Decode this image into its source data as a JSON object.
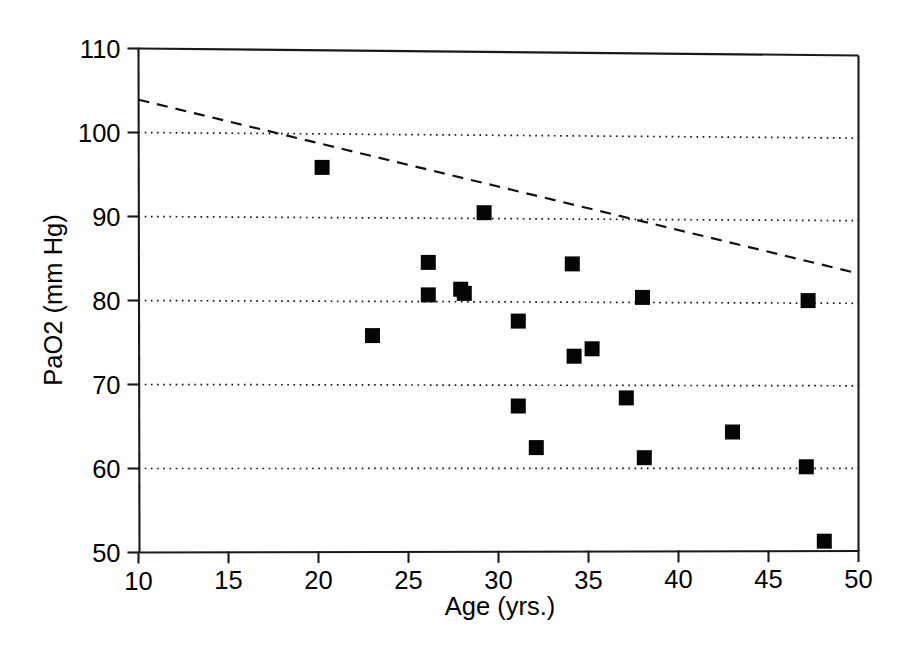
{
  "chart_data": {
    "type": "scatter",
    "title": "",
    "xlabel": "Age (yrs.)",
    "ylabel": "PaO2 (mm Hg)",
    "xlim": [
      10,
      50
    ],
    "ylim": [
      50,
      110
    ],
    "xticks": [
      10,
      15,
      20,
      25,
      30,
      35,
      40,
      45,
      50
    ],
    "yticks": [
      50,
      60,
      70,
      80,
      90,
      100,
      110
    ],
    "xtick_labels": [
      "10",
      "15",
      "20",
      "25",
      "30",
      "35",
      "40",
      "45",
      "50"
    ],
    "ytick_labels": [
      "50",
      "60",
      "70",
      "80",
      "90",
      "100",
      "110"
    ],
    "grid": "horizontal-dotted",
    "legend": "none",
    "marker": {
      "shape": "square",
      "color": "#050505",
      "size": 15
    },
    "series": [
      {
        "name": "PaO2 vs Age",
        "points": [
          {
            "x": 20.2,
            "y": 96.0
          },
          {
            "x": 23.0,
            "y": 75.9
          },
          {
            "x": 26.1,
            "y": 84.7
          },
          {
            "x": 26.1,
            "y": 80.8
          },
          {
            "x": 27.9,
            "y": 81.5
          },
          {
            "x": 28.1,
            "y": 81.0
          },
          {
            "x": 29.2,
            "y": 90.7
          },
          {
            "x": 31.1,
            "y": 77.7
          },
          {
            "x": 31.1,
            "y": 67.5
          },
          {
            "x": 32.1,
            "y": 62.5
          },
          {
            "x": 34.1,
            "y": 84.6
          },
          {
            "x": 34.2,
            "y": 73.5
          },
          {
            "x": 35.2,
            "y": 74.4
          },
          {
            "x": 37.1,
            "y": 68.5
          },
          {
            "x": 38.0,
            "y": 80.6
          },
          {
            "x": 38.1,
            "y": 61.3
          },
          {
            "x": 43.0,
            "y": 64.4
          },
          {
            "x": 47.1,
            "y": 60.2
          },
          {
            "x": 47.2,
            "y": 80.3
          },
          {
            "x": 48.1,
            "y": 51.2
          }
        ]
      }
    ],
    "trendline": {
      "style": "dashed",
      "color": "#111111",
      "x_start": 10,
      "y_start": 103.9,
      "x_end": 50,
      "y_end": 83.6
    },
    "annotations": []
  }
}
